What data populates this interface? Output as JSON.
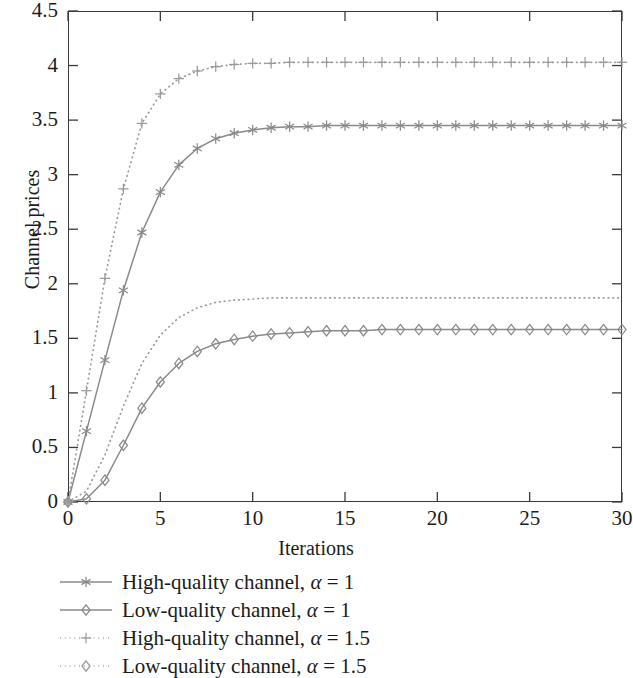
{
  "chart_data": {
    "type": "line",
    "title": "",
    "xlabel": "Iterations",
    "ylabel": "Channel prices",
    "xlim": [
      0,
      30
    ],
    "ylim": [
      0,
      4.5
    ],
    "xticks": [
      0,
      5,
      10,
      15,
      20,
      25,
      30
    ],
    "xtick_labels": [
      "0",
      "5",
      "10",
      "15",
      "20",
      "25",
      "30"
    ],
    "yticks": [
      0,
      0.5,
      1,
      1.5,
      2,
      2.5,
      3,
      3.5,
      4,
      4.5
    ],
    "ytick_labels": [
      "0",
      "0.5",
      "1",
      "1.5",
      "2",
      "2.5",
      "3",
      "3.5",
      "4",
      "4.5"
    ],
    "grid": false,
    "legend_position": "below-axes",
    "x": [
      0,
      1,
      2,
      3,
      4,
      5,
      6,
      7,
      8,
      9,
      10,
      11,
      12,
      13,
      14,
      15,
      16,
      17,
      18,
      19,
      20,
      21,
      22,
      23,
      24,
      25,
      26,
      27,
      28,
      29,
      30
    ],
    "series": [
      {
        "name": "High-quality channel, α = 1",
        "marker": "asterisk",
        "linestyle": "solid",
        "color": "#8a8a8a",
        "values": [
          0,
          0.65,
          1.3,
          1.94,
          2.47,
          2.84,
          3.09,
          3.24,
          3.33,
          3.38,
          3.41,
          3.43,
          3.44,
          3.44,
          3.45,
          3.45,
          3.45,
          3.45,
          3.45,
          3.45,
          3.45,
          3.45,
          3.45,
          3.45,
          3.45,
          3.45,
          3.45,
          3.45,
          3.45,
          3.45,
          3.45
        ]
      },
      {
        "name": "Low-quality channel, α = 1",
        "marker": "diamond",
        "linestyle": "solid",
        "color": "#8a8a8a",
        "values": [
          0,
          0.03,
          0.2,
          0.52,
          0.86,
          1.1,
          1.27,
          1.38,
          1.45,
          1.49,
          1.52,
          1.54,
          1.55,
          1.56,
          1.57,
          1.57,
          1.57,
          1.58,
          1.58,
          1.58,
          1.58,
          1.58,
          1.58,
          1.58,
          1.58,
          1.58,
          1.58,
          1.58,
          1.58,
          1.58,
          1.58
        ]
      },
      {
        "name": "High-quality channel, α = 1.5",
        "marker": "plus",
        "linestyle": "dotted",
        "color": "#9a9a9a",
        "values": [
          0,
          1.02,
          2.05,
          2.87,
          3.47,
          3.74,
          3.88,
          3.95,
          3.99,
          4.01,
          4.02,
          4.02,
          4.03,
          4.03,
          4.03,
          4.03,
          4.03,
          4.03,
          4.03,
          4.03,
          4.03,
          4.03,
          4.03,
          4.03,
          4.03,
          4.03,
          4.03,
          4.03,
          4.03,
          4.03,
          4.03
        ]
      },
      {
        "name": "Low-quality channel, α = 1.5",
        "marker": "none",
        "linestyle": "dotted",
        "color": "#9a9a9a",
        "values": [
          0,
          0.1,
          0.43,
          0.88,
          1.27,
          1.53,
          1.69,
          1.78,
          1.83,
          1.85,
          1.86,
          1.87,
          1.87,
          1.87,
          1.87,
          1.87,
          1.87,
          1.87,
          1.87,
          1.87,
          1.87,
          1.87,
          1.87,
          1.87,
          1.87,
          1.87,
          1.87,
          1.87,
          1.87,
          1.87,
          1.87
        ]
      }
    ]
  },
  "axes": {
    "x_title": "Iterations",
    "y_title": "Channel prices"
  },
  "legend": {
    "entries": [
      {
        "prefix": "High-quality channel, ",
        "alpha": "α",
        "suffix": " = 1",
        "marker": "asterisk",
        "linestyle": "solid"
      },
      {
        "prefix": "Low-quality channel, ",
        "alpha": "α",
        "suffix": " = 1",
        "marker": "diamond",
        "linestyle": "solid"
      },
      {
        "prefix": "High-quality channel, ",
        "alpha": "α",
        "suffix": " = 1.5",
        "marker": "plus",
        "linestyle": "dotted"
      },
      {
        "prefix": "Low-quality channel, ",
        "alpha": "α",
        "suffix": " = 1.5",
        "marker": "diamond",
        "linestyle": "dotted"
      }
    ]
  },
  "colors": {
    "line_gray": "#8a8a8a",
    "dotted_gray": "#9a9a9a",
    "axis": "#3a3a3a",
    "text": "#1a1a1a",
    "background": "#ffffff"
  }
}
